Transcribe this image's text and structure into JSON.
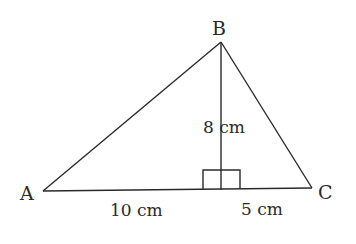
{
  "diagram": {
    "type": "triangle-with-altitude",
    "vertices": {
      "A": "A",
      "B": "B",
      "C": "C"
    },
    "measurements": {
      "height": "8 cm",
      "base_left": "10 cm",
      "base_right": "5 cm"
    },
    "right_angle_marker": true,
    "colors": {
      "stroke": "#2a2a2a",
      "background": "#ffffff"
    }
  }
}
